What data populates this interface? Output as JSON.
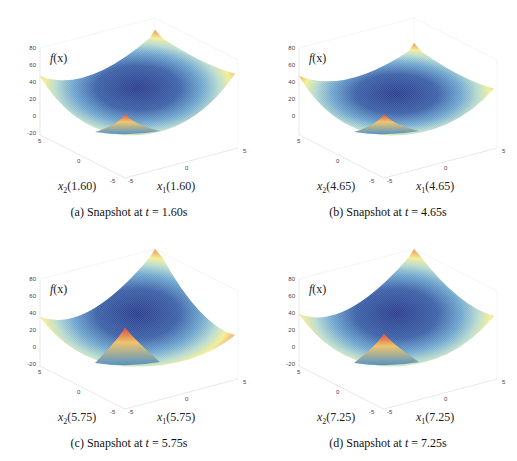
{
  "chart_data": [
    {
      "type": "surface3d",
      "panel": "a",
      "caption_prefix": "(a)  Snapshot at ",
      "caption_var": "t",
      "caption_value": " = 1.60s",
      "zlabel": "f(x)",
      "xlabel": "x1(1.60)",
      "ylabel": "x2(1.60)",
      "zticks": [
        "80",
        "60",
        "40",
        "20",
        "0",
        "-20"
      ],
      "x1ticks": [
        "-5",
        "0",
        "5"
      ],
      "x2ticks": [
        "5",
        "0",
        "-5"
      ],
      "zlim": [
        -20,
        80
      ],
      "x1lim": [
        -5,
        5
      ],
      "x2lim": [
        -5,
        5
      ],
      "corner_heights": {
        "back": 78,
        "left": 48,
        "right": 45,
        "front_bump": 5
      },
      "colormap": "RdYlBu_r"
    },
    {
      "type": "surface3d",
      "panel": "b",
      "caption_prefix": "(b)  Snapshot at ",
      "caption_var": "t",
      "caption_value": " = 4.65s",
      "zlabel": "f(x)",
      "xlabel": "x1(4.65)",
      "ylabel": "x2(4.65)",
      "zticks": [
        "80",
        "60",
        "40",
        "20",
        "0"
      ],
      "x1ticks": [
        "-5",
        "0",
        "5"
      ],
      "x2ticks": [
        "5",
        "0",
        "-5"
      ],
      "zlim": [
        0,
        80
      ],
      "x1lim": [
        -5,
        5
      ],
      "x2lim": [
        -5,
        5
      ],
      "corner_heights": {
        "back": 63,
        "left": 48,
        "right": 28,
        "front_bump": 5
      },
      "colormap": "RdYlBu_r"
    },
    {
      "type": "surface3d",
      "panel": "c",
      "caption_prefix": "(c)  Snapshot at ",
      "caption_var": "t",
      "caption_value": " = 5.75s",
      "zlabel": "f(x)",
      "xlabel": "x1(5.75)",
      "ylabel": "x2(5.75)",
      "zticks": [
        "80",
        "60",
        "40",
        "20",
        "0",
        "-20"
      ],
      "x1ticks": [
        "-5",
        "0",
        "5"
      ],
      "x2ticks": [
        "5",
        "0",
        "-5"
      ],
      "zlim": [
        -20,
        80
      ],
      "x1lim": [
        -5,
        5
      ],
      "x2lim": [
        -5,
        5
      ],
      "corner_heights": {
        "back": 100,
        "left": 37,
        "right": 10,
        "front_bump": 25
      },
      "colormap": "RdYlBu_r"
    },
    {
      "type": "surface3d",
      "panel": "d",
      "caption_prefix": "(d)  Snapshot at ",
      "caption_var": "t",
      "caption_value": " = 7.25s",
      "zlabel": "f(x)",
      "xlabel": "x1(7.25)",
      "ylabel": "x2(7.25)",
      "zticks": [
        "80",
        "60",
        "40",
        "20",
        "0",
        "-20"
      ],
      "x1ticks": [
        "-5",
        "0",
        "5"
      ],
      "x2ticks": [
        "5",
        "0",
        "-5"
      ],
      "zlim": [
        -20,
        80
      ],
      "x1lim": [
        -5,
        5
      ],
      "x2lim": [
        -5,
        5
      ],
      "corner_heights": {
        "back": 100,
        "left": 40,
        "right": 32,
        "front_bump": 18
      },
      "colormap": "RdYlBu_r"
    }
  ],
  "panels": [
    {
      "caption_prefix": "(a)  Snapshot at ",
      "caption_var": "t",
      "caption_value": " = 1.60s",
      "zlabel_f": "f",
      "zlabel_x": "(x)",
      "x1_sym": "x",
      "x1_sub": "1",
      "x1_arg": "(1.60)",
      "x2_sym": "x",
      "x2_sub": "2",
      "x2_arg": "(1.60)",
      "zticks": [
        "80",
        "60",
        "40",
        "20",
        "0",
        "-20"
      ]
    },
    {
      "caption_prefix": "(b)  Snapshot at ",
      "caption_var": "t",
      "caption_value": " = 4.65s",
      "zlabel_f": "f",
      "zlabel_x": "(x)",
      "x1_sym": "x",
      "x1_sub": "1",
      "x1_arg": "(4.65)",
      "x2_sym": "x",
      "x2_sub": "2",
      "x2_arg": "(4.65)",
      "zticks": [
        "80",
        "60",
        "40",
        "20",
        "0",
        ""
      ]
    },
    {
      "caption_prefix": "(c)  Snapshot at ",
      "caption_var": "t",
      "caption_value": " = 5.75s",
      "zlabel_f": "f",
      "zlabel_x": "(x)",
      "x1_sym": "x",
      "x1_sub": "1",
      "x1_arg": "(5.75)",
      "x2_sym": "x",
      "x2_sub": "2",
      "x2_arg": "(5.75)",
      "zticks": [
        "80",
        "60",
        "40",
        "20",
        "0",
        "-20"
      ]
    },
    {
      "caption_prefix": "(d)  Snapshot at ",
      "caption_var": "t",
      "caption_value": " = 7.25s",
      "zlabel_f": "f",
      "zlabel_x": "(x)",
      "x1_sym": "x",
      "x1_sub": "1",
      "x1_arg": "(7.25)",
      "x2_sym": "x",
      "x2_sub": "2",
      "x2_arg": "(7.25)",
      "zticks": [
        "80",
        "60",
        "40",
        "20",
        "0",
        "-20"
      ]
    }
  ],
  "axis_ticks": {
    "x1": [
      "-5",
      "0",
      "5"
    ],
    "x2": [
      "5",
      "0",
      "-5"
    ]
  }
}
